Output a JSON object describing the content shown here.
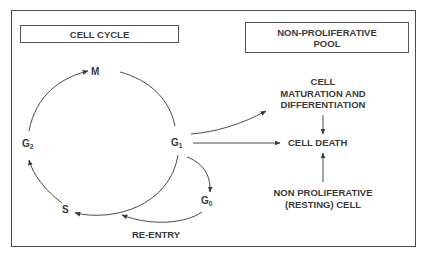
{
  "diagram": {
    "left_panel": {
      "title": "CELL CYCLE"
    },
    "right_panel": {
      "title_line1": "NON-PROLIFERATIVE",
      "title_line2": "POOL"
    },
    "phases": {
      "m": {
        "letter": "M",
        "sub": ""
      },
      "g2": {
        "letter": "G",
        "sub": "2"
      },
      "s": {
        "letter": "S",
        "sub": ""
      },
      "g1": {
        "letter": "G",
        "sub": "1"
      },
      "g0": {
        "letter": "G",
        "sub": "0"
      }
    },
    "labels": {
      "re_entry": "RE-ENTRY",
      "maturation_line1": "CELL",
      "maturation_line2": "MATURATION AND",
      "maturation_line3": "DIFFERENTIATION",
      "cell_death": "CELL DEATH",
      "resting_line1": "NON PROLIFERATIVE",
      "resting_line2": "(RESTING) CELL"
    },
    "edges": [
      {
        "from": "G2",
        "to": "M"
      },
      {
        "from": "M",
        "to": "G1"
      },
      {
        "from": "G1",
        "to": "S"
      },
      {
        "from": "S",
        "to": "G2"
      },
      {
        "from": "G1",
        "to": "G0"
      },
      {
        "from": "G0",
        "to": "S",
        "label": "RE-ENTRY"
      },
      {
        "from": "G1",
        "to": "CELL MATURATION AND DIFFERENTIATION"
      },
      {
        "from": "G1",
        "to": "CELL DEATH"
      },
      {
        "from": "CELL MATURATION AND DIFFERENTIATION",
        "to": "CELL DEATH"
      },
      {
        "from": "NON PROLIFERATIVE (RESTING) CELL",
        "to": "CELL DEATH"
      }
    ],
    "colors": {
      "ink": "#3a3a3a",
      "background": "#ffffff"
    }
  }
}
